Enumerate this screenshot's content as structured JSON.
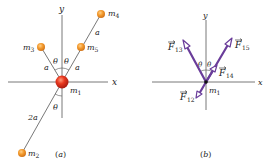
{
  "figure": {
    "panel_a": {
      "caption": "(a)",
      "axis_x": "x",
      "axis_y": "y",
      "masses": [
        {
          "id": "m1",
          "label": "m",
          "sub": "1",
          "color": "#e0301e",
          "size": "large"
        },
        {
          "id": "m2",
          "label": "m",
          "sub": "2",
          "color": "#f29a2e",
          "size": "small"
        },
        {
          "id": "m3",
          "label": "m",
          "sub": "3",
          "color": "#f29a2e",
          "size": "small"
        },
        {
          "id": "m4",
          "label": "m",
          "sub": "4",
          "color": "#f29a2e",
          "size": "small"
        },
        {
          "id": "m5",
          "label": "m",
          "sub": "5",
          "color": "#f29a2e",
          "size": "small"
        }
      ],
      "distances": {
        "m1_m3": "a",
        "m1_m5": "a",
        "m5_m4": "a",
        "m1_m2": "2a"
      },
      "angles": [
        "θ",
        "θ",
        "θ"
      ]
    },
    "panel_b": {
      "caption": "(b)",
      "axis_x": "x",
      "axis_y": "y",
      "origin_label": {
        "label": "m",
        "sub": "1"
      },
      "vector_color": "#6a3d9a",
      "forces": [
        {
          "id": "F13",
          "label": "F",
          "sub": "13"
        },
        {
          "id": "F15",
          "label": "F",
          "sub": "15"
        },
        {
          "id": "F14",
          "label": "F",
          "sub": "14"
        },
        {
          "id": "F12",
          "label": "F",
          "sub": "12"
        }
      ],
      "angles": [
        "θ",
        "θ"
      ]
    }
  }
}
